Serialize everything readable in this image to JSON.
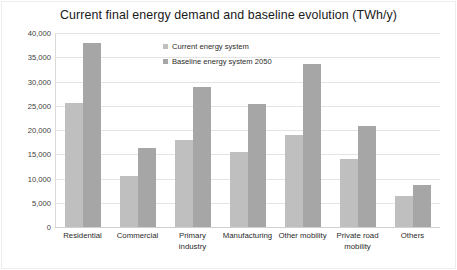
{
  "chart_data": {
    "type": "bar",
    "title": "Current final energy demand and baseline evolution (TWh/y)",
    "xlabel": "",
    "ylabel": "",
    "ylim": [
      0,
      40000
    ],
    "ytick_labels": [
      "40,000",
      "35,000",
      "30,000",
      "25,000",
      "20,000",
      "15,000",
      "10,000",
      "5,000",
      "0"
    ],
    "ytick_values": [
      40000,
      35000,
      30000,
      25000,
      20000,
      15000,
      10000,
      5000,
      0
    ],
    "grid": true,
    "legend_position": "inside-top-center",
    "categories": [
      "Residential",
      "Commercial",
      "Primary industry",
      "Manufacturing",
      "Other mobility",
      "Private road mobility",
      "Others"
    ],
    "series": [
      {
        "name": "Current energy system",
        "color": "#bfbfbf",
        "values": [
          25500,
          10500,
          18000,
          15500,
          19000,
          14000,
          6400
        ]
      },
      {
        "name": "Baseline energy system 2050",
        "color": "#a6a6a6",
        "values": [
          38000,
          16200,
          28900,
          25300,
          33600,
          20900,
          8700
        ]
      }
    ]
  },
  "legend": {
    "items": [
      {
        "label": "Current energy system",
        "color": "#bfbfbf"
      },
      {
        "label": "Baseline energy system 2050",
        "color": "#a6a6a6"
      }
    ]
  },
  "colors": {
    "current_energy_system": "#bfbfbf",
    "baseline_energy_system_2050": "#a6a6a6",
    "gridline": "#e4e4e4",
    "axis": "#d0d0d0",
    "text": "#1a1a1a",
    "background": "#ffffff"
  }
}
